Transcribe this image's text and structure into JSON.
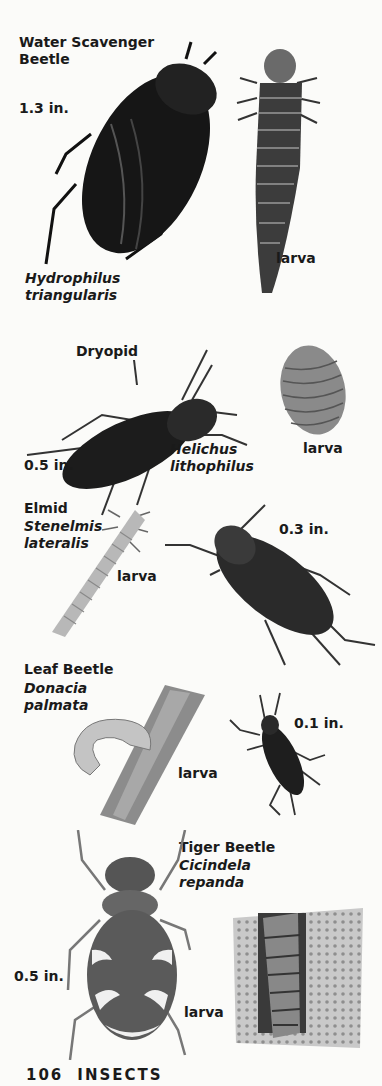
{
  "page": {
    "number": "106",
    "section": "INSECTS"
  },
  "species": [
    {
      "common_name_line1": "Water Scavenger",
      "common_name_line2": "Beetle",
      "size": "1.3 in.",
      "scientific_line1": "Hydrophilus",
      "scientific_line2": "triangularis",
      "larva_label": "larva"
    },
    {
      "common_name": "Dryopid",
      "size": "0.5 in.",
      "scientific_line1": "Helichus",
      "scientific_line2": "lithophilus",
      "larva_label": "larva"
    },
    {
      "common_name": "Elmid",
      "scientific_line1": "Stenelmis",
      "scientific_line2": "lateralis",
      "size": "0.3 in.",
      "larva_label": "larva"
    },
    {
      "common_name": "Leaf Beetle",
      "scientific_line1": "Donacia",
      "scientific_line2": "palmata",
      "size": "0.1 in.",
      "larva_label": "larva"
    },
    {
      "common_name": "Tiger Beetle",
      "scientific_line1": "Cicindela",
      "scientific_line2": "repanda",
      "size": "0.5 in.",
      "larva_label": "larva"
    }
  ]
}
